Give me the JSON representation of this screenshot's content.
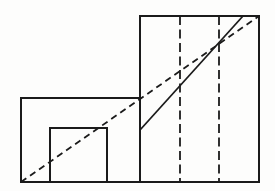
{
  "figure": {
    "canvas": {
      "width": 275,
      "height": 191,
      "background": "#fdfdfc"
    },
    "stroke_color": "#1b1b1b",
    "stroke_width": 2,
    "rectangles": [
      {
        "name": "left-outer-rectangle",
        "x": 21,
        "y": 98,
        "width": 119,
        "height": 84
      },
      {
        "name": "inner-small-square",
        "x": 50,
        "y": 128,
        "width": 57,
        "height": 54
      },
      {
        "name": "tall-right-rectangle",
        "x": 140,
        "y": 16,
        "width": 119,
        "height": 166
      }
    ],
    "lines": [
      {
        "name": "vertical-dashed-line-1",
        "x1": 180,
        "y1": 16,
        "x2": 180,
        "y2": 182,
        "style": "dashed",
        "dash": "9 4.5",
        "width": 1.8
      },
      {
        "name": "vertical-dashed-line-2",
        "x1": 219,
        "y1": 16,
        "x2": 219,
        "y2": 182,
        "style": "dashed",
        "dash": "9 4.5",
        "width": 1.8
      },
      {
        "name": "dashed-diagonal-line",
        "x1": 21,
        "y1": 182,
        "x2": 259,
        "y2": 16,
        "style": "dashed",
        "dash": "6.5 4.5",
        "width": 1.8
      },
      {
        "name": "solid-diagonal-line",
        "x1": 140,
        "y1": 130,
        "x2": 243,
        "y2": 16,
        "style": "solid",
        "dash": "",
        "width": 1.8
      }
    ]
  }
}
